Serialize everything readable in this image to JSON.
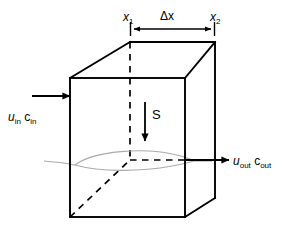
{
  "figure": {
    "type": "schematic-diagram"
  },
  "colors": {
    "stroke": "#000000",
    "plume": "#a8a8a8",
    "background": "#ffffff"
  },
  "labels": {
    "x1": {
      "symbol": "x",
      "subscript": "1",
      "text": "x1"
    },
    "x2": {
      "symbol": "x",
      "subscript": "2",
      "text": "x2"
    },
    "delta_x": {
      "text": "Δx"
    },
    "settling": {
      "text": "S"
    },
    "inflow": {
      "velocity_symbol": "u",
      "velocity_subscript": "in",
      "concentration_symbol": "c",
      "concentration_subscript": "in",
      "text": "u_in c_in"
    },
    "outflow": {
      "velocity_symbol": "u",
      "velocity_subscript": "out",
      "concentration_symbol": "c",
      "concentration_subscript": "out",
      "text": "u_out c_out"
    }
  },
  "geometry": {
    "front_face": {
      "top_left": [
        70,
        78
      ],
      "top_right": [
        185,
        78
      ],
      "bottom_right": [
        185,
        217
      ],
      "bottom_left": [
        70,
        217
      ]
    },
    "back_face": {
      "top_left": [
        130,
        42
      ],
      "top_right": [
        215,
        42
      ],
      "bottom_right": [
        215,
        198
      ],
      "bottom_left": [
        130,
        160
      ]
    },
    "dimension_line": {
      "y": 29,
      "x_start": 131,
      "x_end": 213
    },
    "inflow_arrow": {
      "y": 96,
      "x_start": 32,
      "x_end": 70
    },
    "outflow_arrow": {
      "y": 160,
      "x_start": 185,
      "x_end": 228
    },
    "settling_arrow": {
      "x": 145,
      "y_start": 103,
      "y_end": 140
    },
    "vertical_dashed": {
      "x": 130,
      "y_start": 42,
      "y_end": 160
    }
  },
  "icons": {
    "arrow_right": "arrow-right-icon",
    "arrow_down": "arrow-down-icon",
    "arrow_double": "double-headed-arrow-icon"
  }
}
